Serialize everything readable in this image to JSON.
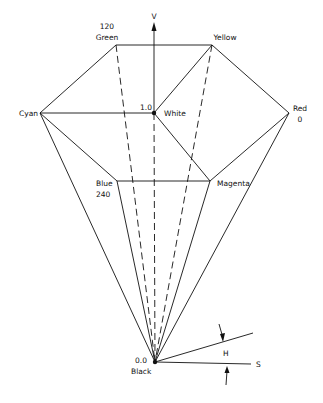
{
  "diagram": {
    "axis_label": "V",
    "vertices": {
      "green": {
        "name": "Green",
        "value": "120"
      },
      "yellow": {
        "name": "Yellow"
      },
      "cyan": {
        "name": "Cyan"
      },
      "white": {
        "name": "White",
        "value": "1.0"
      },
      "red": {
        "name": "Red",
        "value": "0"
      },
      "blue": {
        "name": "Blue",
        "value": "240"
      },
      "magenta": {
        "name": "Magenta"
      },
      "black": {
        "name": "Black",
        "value": "0.0"
      }
    },
    "angle_label": "H",
    "saturation_label": "S"
  }
}
